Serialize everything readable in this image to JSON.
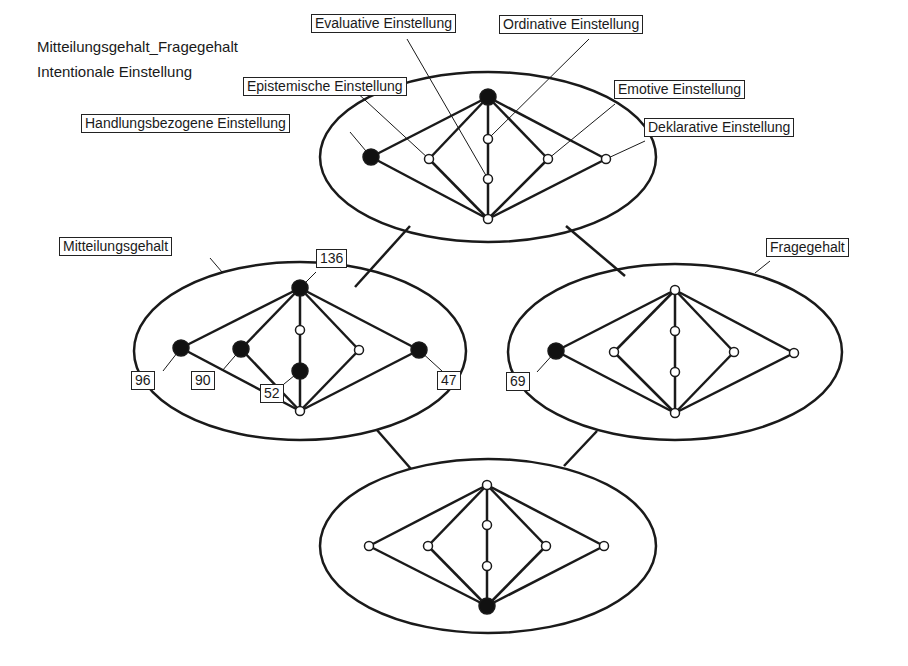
{
  "title": {
    "line1": "Mitteilungsgehalt_Fragegehalt",
    "line2": "Intentionale Einstellung"
  },
  "colors": {
    "stroke": "#1a1a1a",
    "filled_node": "#111111",
    "open_node": "#ffffff",
    "background": "#ffffff"
  },
  "attitude_labels": {
    "evaluative": "Evaluative Einstellung",
    "ordinative": "Ordinative Einstellung",
    "epistemische": "Epistemische Einstellung",
    "emotive": "Emotive Einstellung",
    "handlungsbezogene": "Handlungsbezogene Einstellung",
    "deklarative": "Deklarative Einstellung"
  },
  "clusters": {
    "top": {
      "name": "Mitteilungsgehalt_Fragegehalt"
    },
    "left": {
      "name": "Mitteilungsgehalt",
      "counts": {
        "top": "136",
        "n96": "96",
        "n90": "90",
        "n52": "52",
        "n47": "47"
      }
    },
    "right": {
      "name": "Fragegehalt",
      "counts": {
        "n69": "69"
      }
    },
    "bottom": {
      "name": ""
    }
  }
}
